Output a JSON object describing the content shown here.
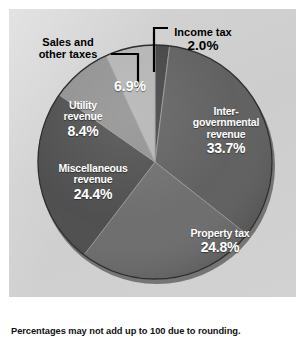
{
  "figure": {
    "background_color": "#ffffff",
    "panel_color": "#d0d0d0",
    "footnote": "Percentages may not add up to 100 due to rounding."
  },
  "chart_data": {
    "type": "pie",
    "title": "",
    "subtitle": "",
    "xlabel": "",
    "ylabel": "",
    "legend_position": "none",
    "grid": false,
    "units": "percent",
    "start_angle_deg": 0,
    "direction": "clockwise",
    "total": 100.2,
    "categories": [
      "Income tax",
      "Inter-governmental revenue",
      "Property tax",
      "Miscellaneous revenue",
      "Utility revenue",
      "Sales and other taxes"
    ],
    "values": [
      2.0,
      33.7,
      24.8,
      24.4,
      8.4,
      6.9
    ],
    "labels": [
      "2.0%",
      "33.7%",
      "24.8%",
      "24.4%",
      "8.4%",
      "6.9%"
    ],
    "colors": [
      "#3f3f3f",
      "#5c5c5c",
      "#6a6a6a",
      "#4a4a4a",
      "#8e8e8e",
      "#b2b2b2"
    ],
    "slices": [
      {
        "name": "Income tax",
        "value": 2.0,
        "label": "2.0%",
        "color": "#3f3f3f",
        "label_style": "callout",
        "name_lines": [
          "Income tax"
        ]
      },
      {
        "name": "Inter-governmental revenue",
        "value": 33.7,
        "label": "33.7%",
        "color": "#5c5c5c",
        "label_style": "inside",
        "name_lines": [
          "Inter-",
          "governmental",
          "revenue"
        ]
      },
      {
        "name": "Property tax",
        "value": 24.8,
        "label": "24.8%",
        "color": "#6a6a6a",
        "label_style": "inside",
        "name_lines": [
          "Property tax"
        ]
      },
      {
        "name": "Miscellaneous revenue",
        "value": 24.4,
        "label": "24.4%",
        "color": "#4a4a4a",
        "label_style": "inside",
        "name_lines": [
          "Miscellaneous",
          "revenue"
        ]
      },
      {
        "name": "Utility revenue",
        "value": 8.4,
        "label": "8.4%",
        "color": "#8e8e8e",
        "label_style": "inside",
        "name_lines": [
          "Utility",
          "revenue"
        ]
      },
      {
        "name": "Sales and other taxes",
        "value": 6.9,
        "label": "6.9%",
        "color": "#b2b2b2",
        "label_style": "callout",
        "name_lines": [
          "Sales and",
          "other taxes"
        ]
      }
    ]
  },
  "labels": {
    "intergovernmental": {
      "line1": "Inter-",
      "line2": "governmental",
      "line3": "revenue",
      "pct": "33.7%"
    },
    "property_tax": {
      "name": "Property tax",
      "pct": "24.8%"
    },
    "miscellaneous": {
      "line1": "Miscellaneous",
      "line2": "revenue",
      "pct": "24.4%"
    },
    "utility": {
      "line1": "Utility",
      "line2": "revenue",
      "pct": "8.4%"
    },
    "sales": {
      "line1": "Sales and",
      "line2": "other taxes",
      "pct": "6.9%"
    },
    "income_tax": {
      "name": "Income tax",
      "pct": "2.0%"
    }
  }
}
